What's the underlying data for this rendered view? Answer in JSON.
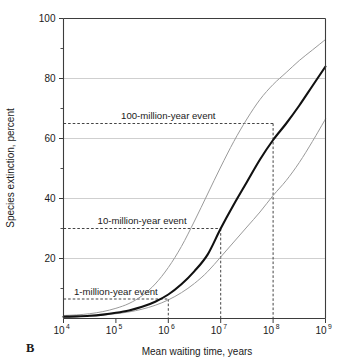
{
  "figure": {
    "panel_label": "B"
  },
  "chart_data": {
    "type": "line",
    "title": "",
    "subtitle": "",
    "xlabel": "Mean waiting time, years",
    "ylabel": "Species extinction, percent",
    "xscale": "log",
    "yscale": "linear",
    "xlim": [
      10000,
      1000000000
    ],
    "ylim": [
      0,
      100
    ],
    "grid": "horizontal",
    "legend": "none",
    "x_tick_labels": [
      "10⁴",
      "10⁵",
      "10⁶",
      "10⁷",
      "10⁸",
      "10⁹"
    ],
    "x_tick_bases": [
      "10",
      "10",
      "10",
      "10",
      "10",
      "10"
    ],
    "x_tick_exponents": [
      "4",
      "5",
      "6",
      "7",
      "8",
      "9"
    ],
    "x_tick_values": [
      10000,
      100000,
      1000000,
      10000000,
      100000000,
      1000000000
    ],
    "y_tick_labels": [
      "20",
      "40",
      "60",
      "80",
      "100"
    ],
    "y_tick_values": [
      20,
      40,
      60,
      80,
      100
    ],
    "y_minor_tick_values": [
      10,
      30,
      50,
      70,
      90
    ],
    "x": [
      4.0,
      4.25,
      4.5,
      4.75,
      5.0,
      5.25,
      5.5,
      5.75,
      6.0,
      6.25,
      6.5,
      6.75,
      7.0,
      7.25,
      7.5,
      7.75,
      8.0,
      8.25,
      8.5,
      8.75,
      9.0
    ],
    "x_note": "x values are log10 of mean waiting time in years",
    "series": [
      {
        "name": "upper bound",
        "color": "#9a9a9a",
        "style": "thin",
        "values": [
          1.0,
          1.2,
          1.6,
          2.3,
          3.4,
          5.0,
          7.6,
          11.5,
          17.0,
          24.0,
          32.5,
          41.5,
          50.5,
          59.0,
          66.5,
          73.0,
          78.0,
          82.0,
          86.0,
          89.5,
          93.0
        ]
      },
      {
        "name": "best estimate",
        "color": "#111111",
        "style": "thick",
        "values": [
          0.6,
          0.7,
          0.9,
          1.3,
          1.9,
          2.7,
          3.9,
          5.6,
          8.0,
          11.4,
          15.8,
          21.3,
          30.0,
          38.0,
          45.5,
          53.0,
          59.5,
          65.0,
          71.0,
          77.5,
          84.0
        ]
      },
      {
        "name": "lower bound",
        "color": "#9a9a9a",
        "style": "thin",
        "values": [
          0.5,
          0.6,
          0.8,
          1.1,
          1.6,
          2.2,
          3.1,
          4.4,
          6.2,
          8.6,
          11.7,
          15.6,
          20.5,
          25.5,
          30.5,
          35.5,
          41.0,
          46.0,
          52.0,
          59.0,
          66.5
        ]
      }
    ],
    "annotations": [
      {
        "label": "1-million-year event",
        "x_value": 1000000,
        "x_log": 6.0,
        "y_value": 6.5,
        "leader_x_start_log": 4.0,
        "has_drop_line": true
      },
      {
        "label": "10-million-year event",
        "x_value": 10000000,
        "x_log": 7.0,
        "y_value": 30.0,
        "leader_x_start_log": 4.0,
        "has_drop_line": true
      },
      {
        "label": "100-million-year event",
        "x_value": 100000000,
        "x_log": 8.0,
        "y_value": 65.0,
        "leader_x_start_log": 4.0,
        "has_drop_line": true
      }
    ]
  },
  "colors": {
    "main_curve": "#111111",
    "bound_curve": "#9a9a9a",
    "gridline": "#c9c9c9",
    "axis": "#3d3d3d",
    "text": "#1a1a1a",
    "background": "#ffffff"
  }
}
